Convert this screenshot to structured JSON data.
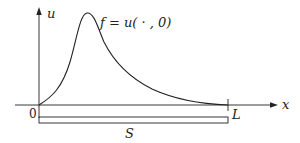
{
  "diagram": {
    "axes": {
      "x_label": "x",
      "y_label": "u",
      "origin_label": "0",
      "end_label": "L"
    },
    "curve": {
      "label": "f = u( · , 0)",
      "description": "initial profile rising from 0 to a sharp peak near the left, then decaying to zero at L"
    },
    "segment": {
      "label": "S",
      "from": "0",
      "to": "L"
    },
    "colors": {
      "stroke": "#222222",
      "background": "#ffffff"
    }
  }
}
